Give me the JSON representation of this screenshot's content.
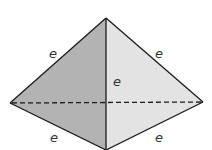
{
  "diagram": {
    "colors": {
      "left_face": "#b3b3b3",
      "right_face": "#e3e3e3",
      "edge": "#1a1a1a"
    },
    "vertices": {
      "apex": [
        106,
        18
      ],
      "left": [
        10,
        103
      ],
      "right": [
        203,
        102
      ],
      "bottom": [
        106,
        150
      ]
    },
    "edge_labels": {
      "upper_left": "e",
      "upper_right": "e",
      "center": "e",
      "lower_left": "e",
      "lower_right": "e"
    }
  }
}
